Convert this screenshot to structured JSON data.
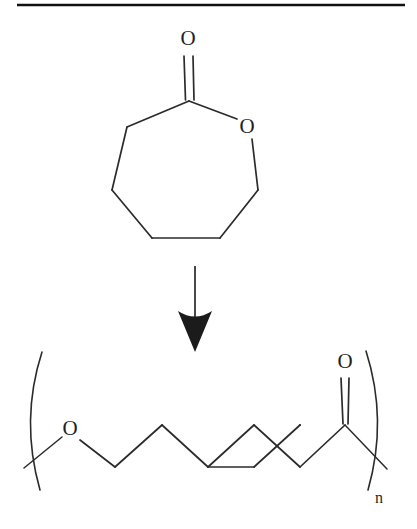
{
  "figure": {
    "kind": "chemical-reaction-scheme",
    "background_color": "#ffffff",
    "line_color": "#2b2b2b",
    "rule": {
      "present": true,
      "color": "#111111"
    }
  },
  "reactant": {
    "name": "epsilon-caprolactone",
    "ring_size": 7,
    "labels": {
      "carbonyl_oxygen": "O",
      "ring_oxygen": "O"
    }
  },
  "arrow": {
    "direction": "down",
    "label": ""
  },
  "product": {
    "name": "poly(epsilon-caprolactone)",
    "labels": {
      "ester_oxygen": "O",
      "carbonyl_oxygen": "O",
      "repeat_subscript": "n"
    },
    "brackets": {
      "left": "(",
      "right": ")"
    }
  }
}
